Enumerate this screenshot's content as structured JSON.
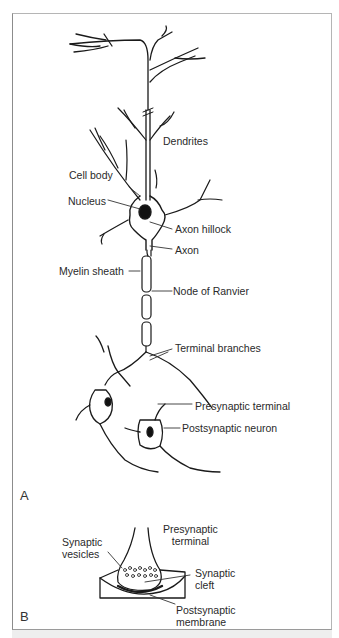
{
  "figure": {
    "panel_a": {
      "id": "A",
      "labels": {
        "dendrites": "Dendrites",
        "cell_body": "Cell body",
        "nucleus": "Nucleus",
        "axon_hillock": "Axon hillock",
        "axon": "Axon",
        "myelin_sheath": "Myelin sheath",
        "node_of_ranvier": "Node of Ranvier",
        "terminal_branches": "Terminal branches",
        "presynaptic_terminal": "Presynaptic terminal",
        "postsynaptic_neuron": "Postsynaptic neuron"
      }
    },
    "panel_b": {
      "id": "B",
      "labels": {
        "presynaptic_terminal_1": "Presynaptic",
        "presynaptic_terminal_2": "terminal",
        "synaptic_vesicles_1": "Synaptic",
        "synaptic_vesicles_2": "vesicles",
        "synaptic_cleft_1": "Synaptic",
        "synaptic_cleft_2": "cleft",
        "postsynaptic_membrane_1": "Postsynaptic",
        "postsynaptic_membrane_2": "membrane"
      }
    }
  }
}
